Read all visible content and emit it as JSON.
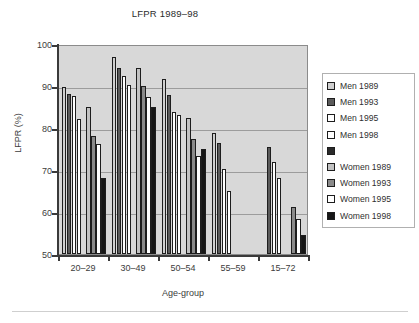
{
  "chart_data": {
    "type": "bar",
    "title": "LFPR 1989–98",
    "xlabel": "Age-group",
    "ylabel": "LFPR (%)",
    "ylim": [
      50,
      100
    ],
    "ytick_labels": [
      "50",
      "60",
      "70",
      "80",
      "90",
      "100"
    ],
    "yticks": [
      50,
      60,
      70,
      80,
      90,
      100
    ],
    "grid": "horizontal",
    "legend_position": "right",
    "categories": [
      "20–29",
      "30–49",
      "50–54",
      "55–59",
      "15–72"
    ],
    "series": [
      {
        "name": "Men 1989",
        "color": "#cfcfcf",
        "values": [
          89.8,
          97.0,
          91.6,
          78.8,
          null
        ]
      },
      {
        "name": "Men 1993",
        "color": "#5a5a5a",
        "values": [
          88.0,
          94.4,
          87.8,
          76.4,
          75.4
        ]
      },
      {
        "name": "Men 1995",
        "color": "#ffffff",
        "values": [
          87.6,
          92.4,
          83.9,
          70.2,
          71.9
        ]
      },
      {
        "name": "Men 1998",
        "color": "#ffffff",
        "values": [
          82.1,
          90.2,
          83.0,
          65.1,
          68.0
        ]
      },
      {
        "name": "",
        "color": "#2a2a2a",
        "values": [
          null,
          null,
          null,
          null,
          null
        ]
      },
      {
        "name": "Women 1989",
        "color": "#c2c2c2",
        "values": [
          84.9,
          94.3,
          82.4,
          null,
          null
        ]
      },
      {
        "name": "Women 1993",
        "color": "#8a8a8a",
        "values": [
          78.2,
          89.9,
          77.4,
          null,
          61.1
        ]
      },
      {
        "name": "Women 1995",
        "color": "#ffffff",
        "values": [
          76.1,
          87.5,
          73.3,
          null,
          58.3
        ]
      },
      {
        "name": "Women 1998",
        "color": "#161616",
        "values": [
          68.2,
          84.9,
          74.9,
          null,
          54.5
        ]
      }
    ]
  },
  "legend": {
    "entries": [
      {
        "label": "Men 1989",
        "swatch": "#cfcfcf"
      },
      {
        "label": "Men 1993",
        "swatch": "#5a5a5a"
      },
      {
        "label": "Men 1995",
        "swatch": "#ffffff"
      },
      {
        "label": "Men 1998",
        "swatch": "#ffffff"
      },
      {
        "label": "",
        "swatch": "#2a2a2a"
      },
      {
        "label": "Women 1989",
        "swatch": "#c2c2c2"
      },
      {
        "label": "Women 1993",
        "swatch": "#8a8a8a"
      },
      {
        "label": "Women 1995",
        "swatch": "#ffffff"
      },
      {
        "label": "Women 1998",
        "swatch": "#161616"
      }
    ]
  },
  "colors": {
    "plot_background": "#d8d8d8",
    "gridline": "#9c9c9c",
    "axis": "#3a3a3a",
    "text": "#3c3c3c",
    "page_background": "#ffffff"
  }
}
